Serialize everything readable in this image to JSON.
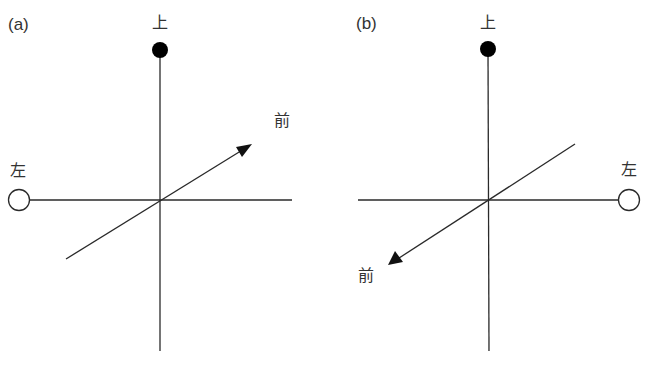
{
  "figure": {
    "panels": [
      {
        "id": "a",
        "id_label": "(a)",
        "labels": {
          "up": "上",
          "left": "左",
          "front": "前"
        },
        "front_direction": "up-right"
      },
      {
        "id": "b",
        "id_label": "(b)",
        "labels": {
          "up": "上",
          "left": "左",
          "front": "前"
        },
        "front_direction": "down-left"
      }
    ],
    "caption": ""
  },
  "colors": {
    "line": "#2a2a2a",
    "filled_marker": "#000000",
    "hollow_marker_fill": "#ffffff"
  }
}
